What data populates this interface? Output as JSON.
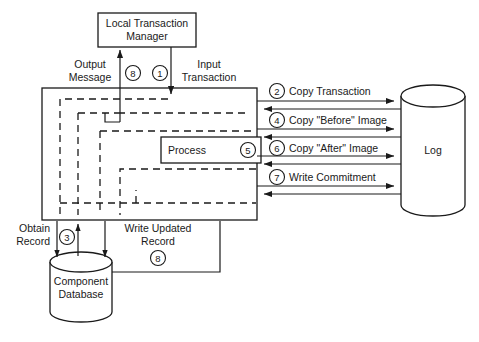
{
  "diagram": {
    "title_nodes": {
      "local_transaction_manager": "Local Transaction\nManager",
      "local_transaction_manager_line1": "Local Transaction",
      "local_transaction_manager_line2": "Manager",
      "process": "Process",
      "log": "Log",
      "component_database_line1": "Component",
      "component_database_line2": "Database"
    },
    "edge_labels": {
      "output_message_line1": "Output",
      "output_message_line2": "Message",
      "input_transaction_line1": "Input",
      "input_transaction_line2": "Transaction",
      "copy_transaction": "Copy Transaction",
      "copy_before_image": "Copy \"Before\" Image",
      "copy_after_image": "Copy \"After\" Image",
      "write_commitment": "Write Commitment",
      "obtain_record_line1": "Obtain",
      "obtain_record_line2": "Record",
      "write_updated_record_line1": "Write Updated",
      "write_updated_record_line2": "Record"
    },
    "step_numbers": {
      "output_message": "8",
      "input_transaction": "1",
      "copy_transaction": "2",
      "obtain_record": "3",
      "copy_before_image": "4",
      "process": "5",
      "copy_after_image": "6",
      "write_commitment": "7",
      "write_updated_record": "8"
    },
    "colors": {
      "line": "#1a1a1a",
      "background": "#ffffff",
      "fill": "#ffffff"
    }
  }
}
